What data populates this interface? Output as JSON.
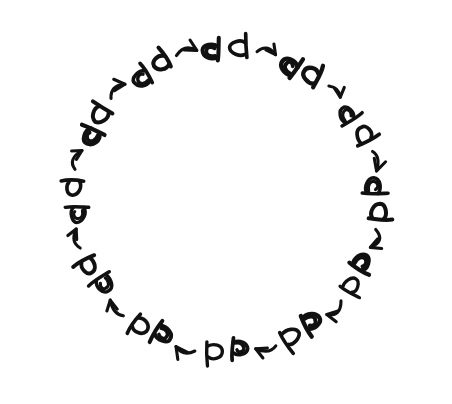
{
  "figure": {
    "background_color": "#ffffff",
    "ink_color": "#111111",
    "canvas": {
      "width": 452,
      "height": 404
    }
  },
  "cycle": {
    "center_x": 226,
    "center_y": 200,
    "radius": 152,
    "step_count": 12,
    "degrees_per_step": 30,
    "direction": "clockwise",
    "start_angle_deg": -90
  },
  "glyph_kinds": {
    "plain": {
      "name": "plain-d-glyph",
      "label": "plain",
      "description": "open loop with a straight tail, drawn like a lowercase d"
    },
    "spiral": {
      "name": "spiral-eye-glyph",
      "label": "spiral",
      "description": "same d form with an extra inner spiral stroke, reading like an eye"
    }
  },
  "steps": [
    {
      "index": 1,
      "angle_deg": -90,
      "rotation_deg": 0,
      "orientation": "upright",
      "clock_position": "12:00"
    },
    {
      "index": 2,
      "angle_deg": -60,
      "rotation_deg": 30,
      "orientation": "tilted-right-30",
      "clock_position": "1:00"
    },
    {
      "index": 3,
      "angle_deg": -30,
      "rotation_deg": 60,
      "orientation": "tilted-right-60",
      "clock_position": "2:00"
    },
    {
      "index": 4,
      "angle_deg": 0,
      "rotation_deg": 90,
      "orientation": "arch-right",
      "clock_position": "3:00"
    },
    {
      "index": 5,
      "angle_deg": 30,
      "rotation_deg": 120,
      "orientation": "tilted-down-120",
      "clock_position": "4:00"
    },
    {
      "index": 6,
      "angle_deg": 60,
      "rotation_deg": 150,
      "orientation": "tilted-down-150",
      "clock_position": "5:00"
    },
    {
      "index": 7,
      "angle_deg": 90,
      "rotation_deg": 180,
      "orientation": "inverted",
      "clock_position": "6:00"
    },
    {
      "index": 8,
      "angle_deg": 120,
      "rotation_deg": 210,
      "orientation": "tilted-left-210",
      "clock_position": "7:00"
    },
    {
      "index": 9,
      "angle_deg": 150,
      "rotation_deg": 240,
      "orientation": "tilted-left-240",
      "clock_position": "8:00"
    },
    {
      "index": 10,
      "angle_deg": 180,
      "rotation_deg": 270,
      "orientation": "arch-left",
      "clock_position": "9:00"
    },
    {
      "index": 11,
      "angle_deg": 210,
      "rotation_deg": 300,
      "orientation": "tilted-up-300",
      "clock_position": "10:00"
    },
    {
      "index": 12,
      "angle_deg": 240,
      "rotation_deg": 330,
      "orientation": "tilted-up-330",
      "clock_position": "11:00"
    }
  ],
  "arrows": {
    "count": 12,
    "style": "hand-drawn curved stroke with open V arrowhead",
    "description": "each arrow connects one glyph pair to the next in clockwise order"
  }
}
